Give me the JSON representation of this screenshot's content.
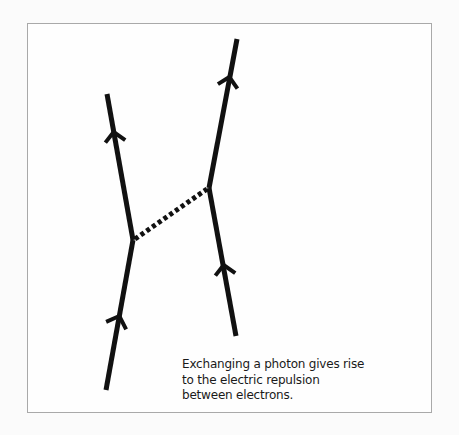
{
  "diagram": {
    "colors": {
      "line": "#111111",
      "frame": "#a9a9a9",
      "background": "#fefefe"
    },
    "electrons": [
      {
        "name": "left-electron",
        "segments": [
          {
            "from": [
              106,
              390
            ],
            "to": [
              133,
              240
            ]
          },
          {
            "from": [
              133,
              240
            ],
            "to": [
              107,
              94
            ]
          }
        ],
        "arrows": [
          [
            119,
            318
          ],
          [
            114,
            134
          ]
        ]
      },
      {
        "name": "right-electron",
        "segments": [
          {
            "from": [
              236,
              336
            ],
            "to": [
              209,
              188
            ]
          },
          {
            "from": [
              209,
              188
            ],
            "to": [
              237,
              39
            ]
          }
        ],
        "arrows": [
          [
            224,
            267
          ],
          [
            229,
            79
          ]
        ]
      }
    ],
    "photon": {
      "label": "photon",
      "from": [
        133,
        240
      ],
      "to": [
        209,
        188
      ],
      "style": "dotted"
    },
    "caption": "Exchanging a photon gives rise to the electric repulsion between electrons."
  }
}
